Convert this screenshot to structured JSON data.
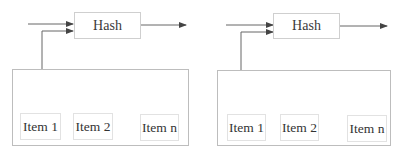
{
  "diagrams": [
    {
      "hash_label": "Hash",
      "items": [
        "Item 1",
        "Item 2",
        "Item n"
      ]
    },
    {
      "hash_label": "Hash",
      "items": [
        "Item 1",
        "Item 2",
        "Item n"
      ]
    }
  ],
  "colors": {
    "line": "#555555",
    "box_border": "#cfcfcf",
    "container_border": "#bdbdbd"
  }
}
